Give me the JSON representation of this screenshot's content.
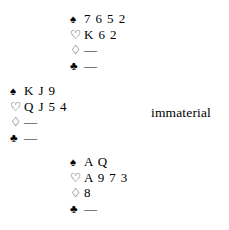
{
  "diagram": {
    "type": "bridge-hand-diagram",
    "background_color": "#ffffff",
    "text_color": "#000000",
    "suit_glyphs": {
      "spades": "♠",
      "hearts": "♡",
      "diamonds": "♢",
      "clubs": "♣"
    },
    "void_marker": "—"
  },
  "hands": {
    "north": {
      "position_label": "north",
      "suits": [
        {
          "suit": "spades",
          "glyph": "♠",
          "cards": "7 6 5 2",
          "void": false
        },
        {
          "suit": "hearts",
          "glyph": "♡",
          "cards": "K 6 2",
          "void": false
        },
        {
          "suit": "diamonds",
          "glyph": "♢",
          "cards": "—",
          "void": true
        },
        {
          "suit": "clubs",
          "glyph": "♣",
          "cards": "—",
          "void": true
        }
      ]
    },
    "west": {
      "position_label": "west",
      "suits": [
        {
          "suit": "spades",
          "glyph": "♠",
          "cards": "K J 9",
          "void": false
        },
        {
          "suit": "hearts",
          "glyph": "♡",
          "cards": "Q J 5 4",
          "void": false
        },
        {
          "suit": "diamonds",
          "glyph": "♢",
          "cards": "—",
          "void": true
        },
        {
          "suit": "clubs",
          "glyph": "♣",
          "cards": "—",
          "void": true
        }
      ]
    },
    "south": {
      "position_label": "south",
      "suits": [
        {
          "suit": "spades",
          "glyph": "♠",
          "cards": "A Q",
          "void": false
        },
        {
          "suit": "hearts",
          "glyph": "♡",
          "cards": "A 9 7 3",
          "void": false
        },
        {
          "suit": "diamonds",
          "glyph": "♢",
          "cards": "8",
          "void": false
        },
        {
          "suit": "clubs",
          "glyph": "♣",
          "cards": "—",
          "void": true
        }
      ]
    },
    "east": {
      "position_label": "east",
      "note": "immaterial"
    }
  }
}
